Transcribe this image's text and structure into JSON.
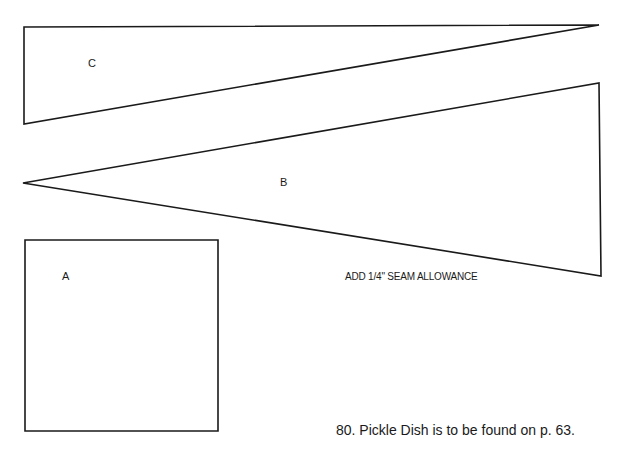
{
  "pieces": {
    "C": {
      "label": "C",
      "points": "24,27 599,25 24,124"
    },
    "B": {
      "label": "B",
      "points": "23,183 599,83 601,276"
    },
    "A": {
      "label": "A",
      "points": "25,240 218,240 218,431 25,431"
    }
  },
  "note": "ADD 1/4\" SEAM ALLOWANCE",
  "caption": "80. Pickle Dish is to be found on p. 63.",
  "colors": {
    "line": "#1a1a1a",
    "background": "#ffffff"
  }
}
